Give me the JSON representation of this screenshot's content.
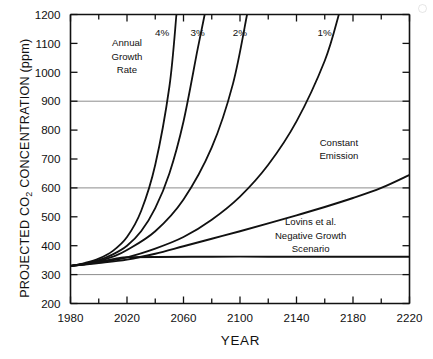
{
  "figure": {
    "y_axis_title": "PROJECTED CO₂ CONCENTRATION (ppm)",
    "x_axis_title": "YEAR"
  },
  "chart_data": {
    "type": "line",
    "title": "",
    "xlabel": "YEAR",
    "ylabel": "PROJECTED CO2 CONCENTRATION (ppm)",
    "xlim": [
      1980,
      2220
    ],
    "ylim": [
      200,
      1200
    ],
    "xticks": [
      1980,
      2000,
      2020,
      2040,
      2060,
      2080,
      2100,
      2120,
      2140,
      2160,
      2180,
      2200,
      2220
    ],
    "xtick_labels": [
      "1980",
      "",
      "2020",
      "",
      "2060",
      "",
      "2100",
      "",
      "2140",
      "",
      "2180",
      "",
      "2220"
    ],
    "yticks": [
      200,
      300,
      400,
      500,
      600,
      700,
      800,
      900,
      1000,
      1100,
      1200
    ],
    "ytick_labels": [
      "200",
      "300",
      "400",
      "500",
      "600",
      "700",
      "800",
      "900",
      "1000",
      "1100",
      "1200"
    ],
    "gridlines_y": [
      300,
      600,
      900
    ],
    "grid": "horizontal-only-at-300-600-900",
    "legend": "inline curve labels",
    "annotations": [
      {
        "name": "annual-growth-rate",
        "lines": [
          "Annual",
          "Growth",
          "Rate"
        ],
        "x": 2020,
        "y": 1090
      },
      {
        "name": "constant-emission",
        "lines": [
          "Constant",
          "Emission"
        ],
        "x": 2170,
        "y": 745
      },
      {
        "name": "lovins-scenario",
        "lines": [
          "Lovins et al.",
          "Negative Growth",
          "Scenario"
        ],
        "x": 2150,
        "y": 470
      }
    ],
    "series": [
      {
        "name": "4%",
        "label": "4%",
        "label_x": 2050,
        "label_y": 1125,
        "x": [
          1980,
          1990,
          2000,
          2010,
          2020,
          2030,
          2040,
          2050,
          2055
        ],
        "values": [
          330,
          340,
          355,
          382,
          430,
          520,
          680,
          950,
          1200
        ]
      },
      {
        "name": "3%",
        "label": "3%",
        "label_x": 2075,
        "label_y": 1125,
        "x": [
          1980,
          1990,
          2000,
          2010,
          2020,
          2030,
          2040,
          2050,
          2060,
          2070,
          2075
        ],
        "values": [
          330,
          338,
          350,
          370,
          400,
          450,
          530,
          650,
          830,
          1080,
          1200
        ]
      },
      {
        "name": "2%",
        "label": "2%",
        "label_x": 2105,
        "label_y": 1125,
        "x": [
          1980,
          1990,
          2000,
          2010,
          2020,
          2040,
          2060,
          2080,
          2095,
          2105
        ],
        "values": [
          330,
          337,
          347,
          362,
          385,
          450,
          560,
          740,
          960,
          1200
        ]
      },
      {
        "name": "1%",
        "label": "1%",
        "label_x": 2165,
        "label_y": 1125,
        "x": [
          1980,
          2000,
          2020,
          2040,
          2060,
          2080,
          2100,
          2120,
          2140,
          2160,
          2170
        ],
        "values": [
          330,
          342,
          360,
          390,
          430,
          490,
          570,
          680,
          830,
          1040,
          1200
        ]
      },
      {
        "name": "Constant Emission",
        "label": "Constant Emission",
        "x": [
          1980,
          2000,
          2020,
          2040,
          2060,
          2080,
          2100,
          2120,
          2140,
          2160,
          2180,
          2200,
          2220
        ],
        "values": [
          330,
          340,
          352,
          372,
          398,
          424,
          450,
          477,
          505,
          534,
          565,
          600,
          645
        ]
      },
      {
        "name": "Lovins et al. Negative Growth Scenario",
        "label": "Lovins et al. Negative Growth Scenario",
        "x": [
          1980,
          1990,
          2000,
          2010,
          2015,
          2020,
          2040,
          2080,
          2120,
          2160,
          2200,
          2220
        ],
        "values": [
          330,
          336,
          344,
          353,
          358,
          360,
          361,
          362,
          362,
          362,
          362,
          362
        ]
      }
    ]
  }
}
